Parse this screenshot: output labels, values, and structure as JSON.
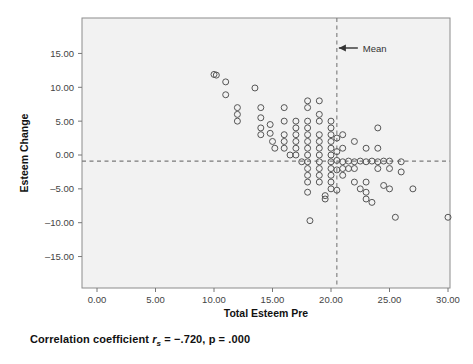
{
  "figure": {
    "type": "scatter-plot",
    "caption_prefix": "Correlation coefficient ",
    "caption_stat_symbol": "r",
    "caption_stat_sub": "s",
    "caption_stat_value": " = −.720, p = .000",
    "caption_full": "Correlation coefficient rs = −.720, p = .000"
  },
  "axes": {
    "x_title": "Total Esteem Pre",
    "y_title": "Esteem Change",
    "x_ticks": [
      "0.00",
      "5.00",
      "10.00",
      "15.00",
      "20.00",
      "25.00",
      "30.00"
    ],
    "y_ticks": [
      "15.00",
      "10.00",
      "5.00",
      "0.00",
      "–5.00",
      "–10.00",
      "–15.00"
    ]
  },
  "annotations": {
    "mean_label": "Mean"
  },
  "colors": {
    "panel_fill": "#f2f2f2",
    "panel_border": "#8c8c8c",
    "marker_stroke": "#555555",
    "reference_line": "#7a7a7a",
    "text": "#1a1a1a"
  },
  "chart_data": {
    "type": "scatter",
    "title": "",
    "xlabel": "Total Esteem Pre",
    "ylabel": "Esteem Change",
    "xlim": [
      -1.5,
      31.5
    ],
    "ylim": [
      -17.0,
      16.5
    ],
    "xticks": [
      0,
      5,
      10,
      15,
      20,
      25,
      30
    ],
    "yticks": [
      15,
      10,
      5,
      0,
      -5,
      -10,
      -15
    ],
    "grid": false,
    "legend": "none",
    "marker": "open-circle",
    "reference_lines": [
      {
        "orientation": "vertical",
        "value": 20.5,
        "style": "dashed",
        "label": "Mean"
      },
      {
        "orientation": "horizontal",
        "value": -0.9,
        "style": "dashed",
        "label": ""
      }
    ],
    "correlation": {
      "statistic": "r_s",
      "value": -0.72,
      "p": 0.0
    },
    "points": [
      [
        10.0,
        11.9
      ],
      [
        10.2,
        11.8
      ],
      [
        11.0,
        10.8
      ],
      [
        11.0,
        8.9
      ],
      [
        12.0,
        7.0
      ],
      [
        12.0,
        6.0
      ],
      [
        12.0,
        5.0
      ],
      [
        13.5,
        9.9
      ],
      [
        14.0,
        7.0
      ],
      [
        14.0,
        5.5
      ],
      [
        14.0,
        4.0
      ],
      [
        14.0,
        3.0
      ],
      [
        14.8,
        4.5
      ],
      [
        14.8,
        3.2
      ],
      [
        15.0,
        2.0
      ],
      [
        15.2,
        1.0
      ],
      [
        16.0,
        7.0
      ],
      [
        16.0,
        5.0
      ],
      [
        16.0,
        3.0
      ],
      [
        16.0,
        2.0
      ],
      [
        16.0,
        1.0
      ],
      [
        16.5,
        0.0
      ],
      [
        17.0,
        5.0
      ],
      [
        17.0,
        4.0
      ],
      [
        17.0,
        3.0
      ],
      [
        17.0,
        2.0
      ],
      [
        17.0,
        1.0
      ],
      [
        17.0,
        0.0
      ],
      [
        17.5,
        -1.0
      ],
      [
        18.0,
        8.0
      ],
      [
        18.0,
        7.0
      ],
      [
        18.0,
        5.0
      ],
      [
        18.0,
        4.0
      ],
      [
        18.0,
        3.0
      ],
      [
        18.0,
        2.0
      ],
      [
        18.0,
        1.0
      ],
      [
        18.0,
        0.0
      ],
      [
        18.0,
        -1.0
      ],
      [
        18.0,
        -2.0
      ],
      [
        18.0,
        -3.0
      ],
      [
        18.0,
        -4.0
      ],
      [
        18.0,
        -5.5
      ],
      [
        18.2,
        -9.7
      ],
      [
        19.0,
        8.0
      ],
      [
        19.0,
        6.0
      ],
      [
        19.0,
        5.0
      ],
      [
        19.0,
        3.0
      ],
      [
        19.0,
        2.0
      ],
      [
        19.0,
        1.0
      ],
      [
        19.0,
        0.0
      ],
      [
        19.0,
        -1.0
      ],
      [
        19.0,
        -2.0
      ],
      [
        19.0,
        -3.0
      ],
      [
        19.0,
        -4.0
      ],
      [
        19.5,
        -6.0
      ],
      [
        19.5,
        -6.5
      ],
      [
        20.0,
        5.0
      ],
      [
        20.0,
        4.0
      ],
      [
        20.0,
        3.0
      ],
      [
        20.0,
        2.0
      ],
      [
        20.0,
        1.0
      ],
      [
        20.0,
        0.0
      ],
      [
        20.0,
        -1.0
      ],
      [
        20.0,
        -2.0
      ],
      [
        20.0,
        -3.0
      ],
      [
        20.0,
        -4.0
      ],
      [
        20.0,
        -5.0
      ],
      [
        20.5,
        2.5
      ],
      [
        20.5,
        0.5
      ],
      [
        20.5,
        -0.8
      ],
      [
        20.5,
        -2.2
      ],
      [
        20.5,
        -5.2
      ],
      [
        21.0,
        3.0
      ],
      [
        21.0,
        1.0
      ],
      [
        21.0,
        -1.0
      ],
      [
        21.0,
        -2.0
      ],
      [
        21.0,
        -3.0
      ],
      [
        21.5,
        -0.9
      ],
      [
        21.5,
        -2.0
      ],
      [
        22.0,
        2.0
      ],
      [
        22.0,
        -1.0
      ],
      [
        22.0,
        -2.0
      ],
      [
        22.0,
        -4.0
      ],
      [
        22.5,
        -0.9
      ],
      [
        22.5,
        -5.0
      ],
      [
        23.0,
        1.0
      ],
      [
        23.0,
        -1.0
      ],
      [
        23.0,
        -4.0
      ],
      [
        23.0,
        -5.5
      ],
      [
        23.0,
        -6.5
      ],
      [
        23.5,
        -0.9
      ],
      [
        23.5,
        -7.0
      ],
      [
        24.0,
        4.0
      ],
      [
        24.0,
        1.0
      ],
      [
        24.0,
        -1.0
      ],
      [
        24.0,
        -2.0
      ],
      [
        24.5,
        -0.9
      ],
      [
        24.5,
        -4.5
      ],
      [
        25.0,
        -0.9
      ],
      [
        25.0,
        -2.0
      ],
      [
        25.0,
        -5.0
      ],
      [
        25.5,
        -9.2
      ],
      [
        26.0,
        -1.0
      ],
      [
        26.0,
        -2.5
      ],
      [
        27.0,
        -5.0
      ],
      [
        30.0,
        -9.2
      ]
    ]
  }
}
